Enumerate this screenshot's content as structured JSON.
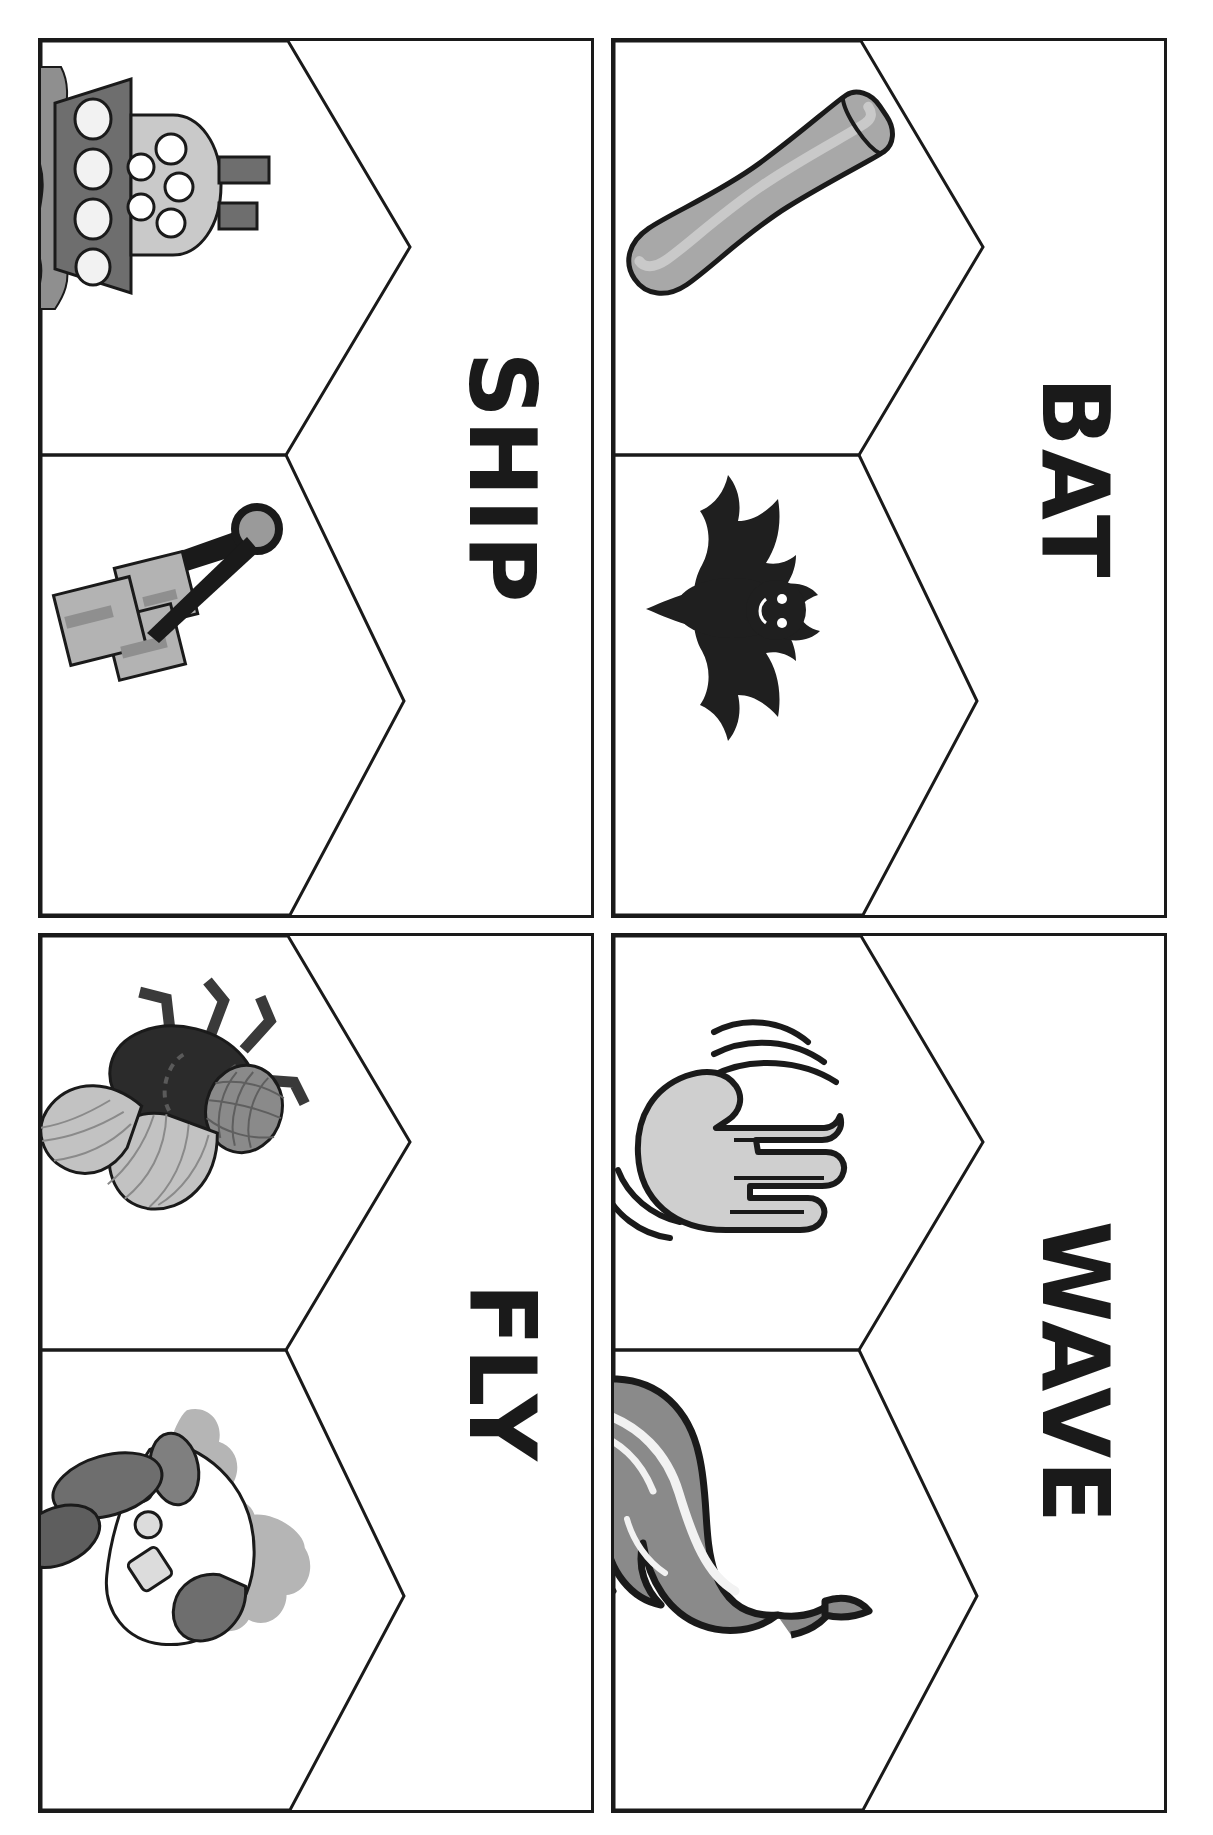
{
  "sheet": {
    "title": "Multiple-meaning word picture cards",
    "orientation": "landscape-rotated",
    "ink_color": "#1a1a1a",
    "paper_color": "#ffffff",
    "rows": 2,
    "columns": 2
  },
  "cards": [
    {
      "word": "SHIP",
      "position": "top-left",
      "cells": [
        {
          "slot": "top",
          "icon": "ship-boat-icon",
          "meaning": "a large boat / vessel",
          "colors": {
            "hull": "#6e6e6e",
            "cabin": "#c9c9c9",
            "water": "#8f8f8f",
            "porthole": "#f2f2f2",
            "outline": "#1a1a1a"
          }
        },
        {
          "slot": "bottom",
          "icon": "shipping-handcart-icon",
          "meaning": "to send / deliver a package",
          "colors": {
            "box": "#b3b3b3",
            "box_shade": "#8f8f8f",
            "frame": "#1a1a1a",
            "wheel": "#9a9a9a"
          }
        }
      ]
    },
    {
      "word": "BAT",
      "position": "top-right",
      "cells": [
        {
          "slot": "top",
          "icon": "baseball-bat-icon",
          "meaning": "a baseball bat",
          "colors": {
            "wood": "#a8a8a8",
            "wood_light": "#c9c9c9",
            "outline": "#1a1a1a"
          }
        },
        {
          "slot": "bottom",
          "icon": "bat-animal-icon",
          "meaning": "a flying animal",
          "colors": {
            "body": "#1f1f1f",
            "outline": "#000000"
          }
        }
      ]
    },
    {
      "word": "FLY",
      "position": "bottom-left",
      "cells": [
        {
          "slot": "top",
          "icon": "housefly-insect-icon",
          "meaning": "an insect",
          "colors": {
            "body": "#2b2b2b",
            "head": "#8a8a8a",
            "wing": "#c2c2c2",
            "legs": "#3a3a3a",
            "outline": "#1a1a1a"
          }
        },
        {
          "slot": "bottom",
          "icon": "airplane-flying-icon",
          "meaning": "to travel through the air",
          "colors": {
            "fuselage": "#ffffff",
            "cloud": "#b5b5b5",
            "wing": "#7f7f7f",
            "nose": "#6e6e6e",
            "window": "#dcdcdc",
            "outline": "#1a1a1a"
          }
        }
      ]
    },
    {
      "word": "WAVE",
      "position": "bottom-right",
      "cells": [
        {
          "slot": "top",
          "icon": "waving-hand-icon",
          "meaning": "to wave your hand hello",
          "colors": {
            "hand": "#cfcfcf",
            "motion_lines": "#1a1a1a",
            "outline": "#1a1a1a"
          }
        },
        {
          "slot": "bottom",
          "icon": "ocean-wave-icon",
          "meaning": "a wave of water",
          "colors": {
            "water": "#8a8a8a",
            "foam": "#f2f2f2",
            "outline": "#1a1a1a"
          }
        }
      ]
    }
  ]
}
